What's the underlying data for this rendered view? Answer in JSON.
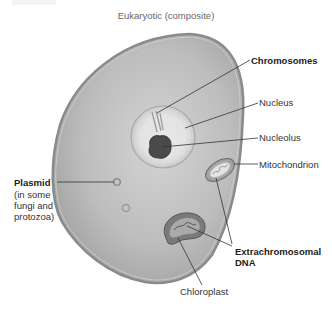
{
  "title": "Eukaryotic (composite)",
  "labels": {
    "chromosomes": "Chromosomes",
    "nucleus": "Nucleus",
    "nucleolus": "Nucleolus",
    "mitochondrion": "Mitochondrion",
    "plasmid": "Plasmid",
    "plasmid_note_1": "(in some",
    "plasmid_note_2": "fungi and",
    "plasmid_note_3": "protozoa)",
    "extrachromosomal_1": "Extrachromosomal",
    "extrachromosomal_2": "DNA",
    "chloroplast": "Chloroplast"
  },
  "colors": {
    "cell_fill": "#b9b9b9",
    "cell_edge": "#8a8a8a",
    "nucleus_fill": "#e2e2e2",
    "nucleolus_fill": "#4a4a4a",
    "leader_line": "#333333",
    "text": "#333333"
  }
}
